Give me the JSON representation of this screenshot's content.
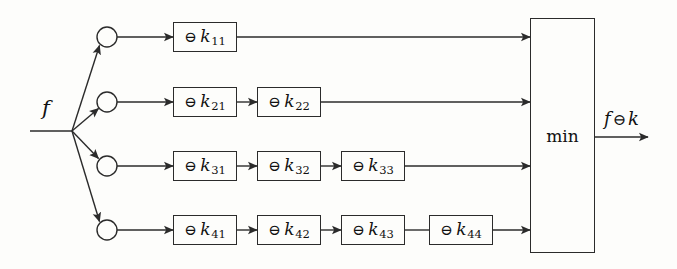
{
  "diagram": {
    "input_label": "f",
    "output_label_parts": {
      "operand": "f",
      "operator": "⊖",
      "kernel": "k"
    },
    "output_label": "f ⊖ k",
    "combiner": {
      "label": "min",
      "name": "min-block"
    },
    "operator_symbol": "⊖",
    "kernel_symbol": "k",
    "colors": {
      "stroke": "#2b2b2b",
      "text": "#111111",
      "background": "#fdfdfb"
    },
    "junction": {
      "name": "fan-out-junction",
      "x": 72,
      "y": 131
    },
    "branches": [
      {
        "index": 1,
        "node_name": "branch-node-1",
        "circle": {
          "cx": 107,
          "cy": 37,
          "r": 10
        },
        "stages": [
          {
            "id": "k11",
            "symbol": "⊖",
            "kernel": "k",
            "subscript": "11",
            "text": "⊖ k11"
          }
        ]
      },
      {
        "index": 2,
        "node_name": "branch-node-2",
        "circle": {
          "cx": 107,
          "cy": 102,
          "r": 10
        },
        "stages": [
          {
            "id": "k21",
            "symbol": "⊖",
            "kernel": "k",
            "subscript": "21",
            "text": "⊖ k21"
          },
          {
            "id": "k22",
            "symbol": "⊖",
            "kernel": "k",
            "subscript": "22",
            "text": "⊖ k22"
          }
        ]
      },
      {
        "index": 3,
        "node_name": "branch-node-3",
        "circle": {
          "cx": 107,
          "cy": 166,
          "r": 10
        },
        "stages": [
          {
            "id": "k31",
            "symbol": "⊖",
            "kernel": "k",
            "subscript": "31",
            "text": "⊖ k31"
          },
          {
            "id": "k32",
            "symbol": "⊖",
            "kernel": "k",
            "subscript": "32",
            "text": "⊖ k32"
          },
          {
            "id": "k33",
            "symbol": "⊖",
            "kernel": "k",
            "subscript": "33",
            "text": "⊖ k33"
          }
        ]
      },
      {
        "index": 4,
        "node_name": "branch-node-4",
        "circle": {
          "cx": 107,
          "cy": 230,
          "r": 10
        },
        "stages": [
          {
            "id": "k41",
            "symbol": "⊖",
            "kernel": "k",
            "subscript": "41",
            "text": "⊖ k41"
          },
          {
            "id": "k42",
            "symbol": "⊖",
            "kernel": "k",
            "subscript": "42",
            "text": "⊖ k42"
          },
          {
            "id": "k43",
            "symbol": "⊖",
            "kernel": "k",
            "subscript": "43",
            "text": "⊖ k43"
          },
          {
            "id": "k44",
            "symbol": "⊖",
            "kernel": "k",
            "subscript": "44",
            "text": "⊖ k44"
          }
        ]
      }
    ]
  }
}
